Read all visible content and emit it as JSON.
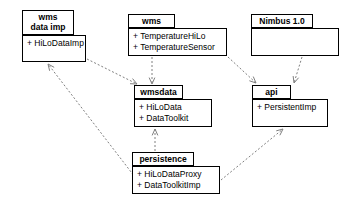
{
  "diagram": {
    "type": "uml-package-dependency-diagram",
    "background": "#ffffff",
    "line_color": "#808080",
    "border_color": "#000000",
    "packages": [
      {
        "id": "wms-data-imp",
        "name": "wms\ndata imp",
        "name_lines": [
          "wms",
          "data imp"
        ],
        "members": [
          "+ HiLoDataImp"
        ],
        "tab": {
          "x": 22,
          "y": 10,
          "w": 52,
          "h": 25
        },
        "body": {
          "x": 22,
          "y": 35,
          "w": 64,
          "h": 27
        }
      },
      {
        "id": "wms",
        "name": "wms",
        "name_lines": [
          "wms"
        ],
        "members": [
          "+ TemperatureHiLo",
          "+ TemperatureSensor"
        ],
        "tab": {
          "x": 128,
          "y": 14,
          "w": 47,
          "h": 14
        },
        "body": {
          "x": 128,
          "y": 28,
          "w": 99,
          "h": 28
        }
      },
      {
        "id": "nimbus",
        "name": "Nimbus 1.0",
        "name_lines": [
          "Nimbus 1.0"
        ],
        "members": [],
        "tab": {
          "x": 251,
          "y": 14,
          "w": 62,
          "h": 14
        },
        "body": {
          "x": 251,
          "y": 28,
          "w": 88,
          "h": 28
        }
      },
      {
        "id": "wmsdata",
        "name": "wmsdata",
        "name_lines": [
          "wmsdata"
        ],
        "members": [
          "+ HiLoData",
          "+ DataToolkit"
        ],
        "tab": {
          "x": 134,
          "y": 85,
          "w": 49,
          "h": 14
        },
        "body": {
          "x": 134,
          "y": 99,
          "w": 78,
          "h": 28
        }
      },
      {
        "id": "api",
        "name": "api",
        "name_lines": [
          "api"
        ],
        "members": [
          "+ PersistentImp"
        ],
        "tab": {
          "x": 252,
          "y": 85,
          "w": 39,
          "h": 14
        },
        "body": {
          "x": 252,
          "y": 99,
          "w": 76,
          "h": 28
        }
      },
      {
        "id": "persistence",
        "name": "persistence",
        "name_lines": [
          "persistence"
        ],
        "members": [
          "+ HiLoDataProxy",
          "+ DataToolkitImp"
        ],
        "tab": {
          "x": 132,
          "y": 152,
          "w": 62,
          "h": 14
        },
        "body": {
          "x": 132,
          "y": 166,
          "w": 88,
          "h": 28
        }
      }
    ],
    "dependencies": [
      {
        "id": "dep-wmsdataimp-to-wmsdata",
        "from": "wms-data-imp",
        "to": "wmsdata",
        "style": "dashed",
        "arrow": "open",
        "x1": 87,
        "y1": 59,
        "x2": 137,
        "y2": 84
      },
      {
        "id": "dep-wms-to-wmsdata",
        "from": "wms",
        "to": "wmsdata",
        "style": "dashed",
        "arrow": "open",
        "x1": 152,
        "y1": 57,
        "x2": 152,
        "y2": 84
      },
      {
        "id": "dep-wms-to-api",
        "from": "wms",
        "to": "api",
        "style": "dashed",
        "arrow": "open",
        "x1": 228,
        "y1": 57,
        "x2": 256,
        "y2": 83
      },
      {
        "id": "dep-nimbus-to-api",
        "from": "nimbus",
        "to": "api",
        "style": "dashed",
        "arrow": "open",
        "x1": 302,
        "y1": 57,
        "x2": 294,
        "y2": 83
      },
      {
        "id": "dep-persistence-to-wmsdata",
        "from": "persistence",
        "to": "wmsdata",
        "style": "dashed",
        "arrow": "open",
        "x1": 155,
        "y1": 151,
        "x2": 155,
        "y2": 129
      },
      {
        "id": "dep-persistence-to-api",
        "from": "persistence",
        "to": "api",
        "style": "dashed",
        "arrow": "open",
        "x1": 221,
        "y1": 180,
        "x2": 283,
        "y2": 129
      },
      {
        "id": "dep-persistence-to-wmsdataimp",
        "from": "persistence",
        "to": "wms-data-imp",
        "style": "dashed",
        "arrow": "open",
        "x1": 148,
        "y1": 194,
        "x2": 48,
        "y2": 64
      }
    ]
  }
}
